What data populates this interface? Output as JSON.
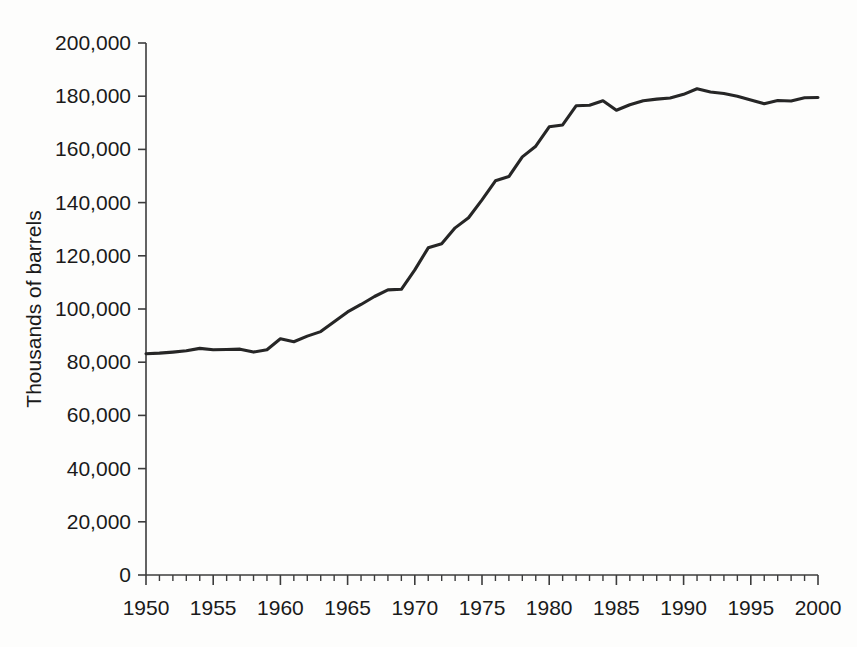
{
  "chart_data": {
    "type": "line",
    "title": "",
    "subtitle": "",
    "xlabel": "",
    "ylabel": "Thousands of barrels",
    "xlim": [
      1950,
      2000
    ],
    "ylim": [
      0,
      200000
    ],
    "grid": false,
    "legend": false,
    "legend_position": "none",
    "y_ticks": [
      0,
      20000,
      40000,
      60000,
      80000,
      100000,
      120000,
      140000,
      160000,
      180000,
      200000
    ],
    "y_tick_labels": [
      "0",
      "20,000",
      "40,000",
      "60,000",
      "80,000",
      "100,000",
      "120,000",
      "140,000",
      "160,000",
      "180,000",
      "200,000"
    ],
    "x_ticks": [
      1950,
      1955,
      1960,
      1965,
      1970,
      1975,
      1980,
      1985,
      1990,
      1995,
      2000
    ],
    "x_tick_labels": [
      "1950",
      "1955",
      "1960",
      "1965",
      "1970",
      "1975",
      "1980",
      "1985",
      "1990",
      "1995",
      "2000"
    ],
    "x_minor_tick_interval": 1,
    "series": [
      {
        "name": "Thousands of barrels",
        "color": "#262626",
        "x": [
          1950,
          1951,
          1952,
          1953,
          1954,
          1955,
          1956,
          1957,
          1958,
          1959,
          1960,
          1961,
          1962,
          1963,
          1964,
          1965,
          1966,
          1967,
          1968,
          1969,
          1970,
          1971,
          1972,
          1973,
          1974,
          1975,
          1976,
          1977,
          1978,
          1979,
          1980,
          1981,
          1982,
          1983,
          1984,
          1985,
          1986,
          1987,
          1988,
          1989,
          1990,
          1991,
          1992,
          1993,
          1994,
          1995,
          1996,
          1997,
          1998,
          1999,
          2000
        ],
        "values": [
          83200,
          83400,
          83800,
          84300,
          85200,
          84700,
          84800,
          84900,
          83800,
          84700,
          88800,
          87700,
          89800,
          91500,
          95200,
          98900,
          101700,
          104700,
          107200,
          107400,
          114700,
          123000,
          124500,
          130500,
          134300,
          141000,
          148200,
          149800,
          157200,
          161200,
          168500,
          169200,
          176400,
          176600,
          178300,
          174700,
          176800,
          178300,
          178900,
          179300,
          180700,
          182800,
          181600,
          181000,
          180000,
          178600,
          177200,
          178400,
          178200,
          179400,
          179500
        ]
      }
    ],
    "annotations": []
  },
  "axes": {
    "y_axis_name": "y-axis",
    "x_axis_name": "x-axis"
  }
}
